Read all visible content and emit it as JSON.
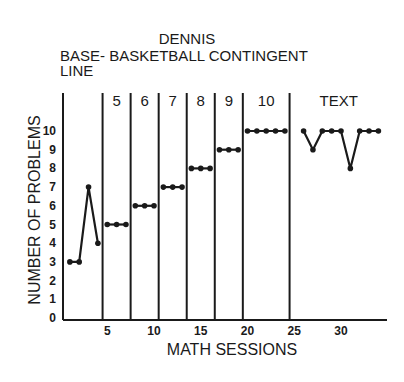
{
  "chart_data": {
    "type": "line",
    "title": "DENNIS",
    "subtitle_lines": [
      "BASE- BASKETBALL CONTINGENT",
      "LINE"
    ],
    "xlabel": "MATH SESSIONS",
    "ylabel": "NUMBER OF PROBLEMS",
    "xlim": [
      0,
      35
    ],
    "ylim": [
      0,
      10
    ],
    "x_ticks": [
      5,
      10,
      15,
      20,
      25,
      30
    ],
    "y_ticks": [
      0,
      1,
      2,
      3,
      4,
      5,
      6,
      7,
      8,
      9,
      10
    ],
    "grid": false,
    "legend": "none",
    "phase_change_lines": [
      4.5,
      7.5,
      10.5,
      13.5,
      16.5,
      19.5,
      24.5
    ],
    "phases": [
      {
        "label": "",
        "name": "Baseline",
        "x": [
          1,
          2,
          3,
          4
        ],
        "y": [
          3,
          3,
          7,
          4
        ]
      },
      {
        "label": "5",
        "name": "Criterion 5",
        "x": [
          5,
          6,
          7
        ],
        "y": [
          5,
          5,
          5
        ]
      },
      {
        "label": "6",
        "name": "Criterion 6",
        "x": [
          8,
          9,
          10
        ],
        "y": [
          6,
          6,
          6
        ]
      },
      {
        "label": "7",
        "name": "Criterion 7",
        "x": [
          11,
          12,
          13
        ],
        "y": [
          7,
          7,
          7
        ]
      },
      {
        "label": "8",
        "name": "Criterion 8",
        "x": [
          14,
          15,
          16
        ],
        "y": [
          8,
          8,
          8
        ]
      },
      {
        "label": "9",
        "name": "Criterion 9",
        "x": [
          17,
          18,
          19
        ],
        "y": [
          9,
          9,
          9
        ]
      },
      {
        "label": "10",
        "name": "Criterion 10",
        "x": [
          20,
          21,
          22,
          23,
          24
        ],
        "y": [
          10,
          10,
          10,
          10,
          10
        ]
      },
      {
        "label": "TEXT",
        "name": "Text",
        "x": [
          26,
          27,
          28,
          29,
          30,
          31,
          32,
          33,
          34
        ],
        "y": [
          10,
          9,
          10,
          10,
          10,
          8,
          10,
          10,
          10
        ]
      }
    ]
  }
}
